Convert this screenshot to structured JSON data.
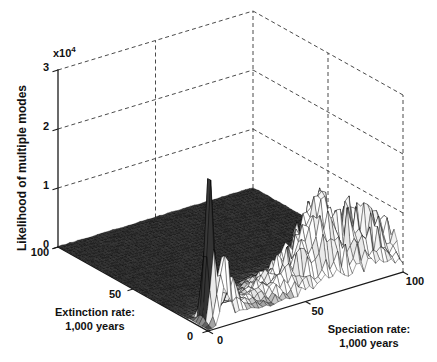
{
  "labels": {
    "z_title": "Likelihood of multiple modes",
    "mult_base": "x10",
    "mult_exp": "4",
    "x1": "Speciation rate:",
    "x2": "1,000 years",
    "y1": "Extinction rate:",
    "y2": "1,000 years"
  },
  "chart_data": {
    "type": "surface",
    "title": "",
    "x_axis": {
      "label": "Speciation rate: 1,000 years",
      "range": [
        0,
        100
      ],
      "ticks": [
        "0",
        "50",
        "100"
      ]
    },
    "y_axis": {
      "label": "Extinction rate: 1,000 years",
      "range": [
        0,
        100
      ],
      "ticks": [
        "0",
        "50",
        "100"
      ]
    },
    "z_axis": {
      "label": "Likelihood of multiple modes",
      "range": [
        0,
        30000
      ],
      "ticks": [
        "0",
        "1",
        "2",
        "3"
      ],
      "multiplier": 10000
    },
    "grid": {
      "style": "dashed",
      "back_walls": true
    },
    "colors": {
      "background": "#ffffff",
      "axis": "#1a1a1a",
      "grid_line": "#4a4a4a",
      "mesh_line": "#000000",
      "surface_dark": "#2f2f2f",
      "surface_light": "#fafafa"
    },
    "key_features": [
      {
        "name": "dominant narrow spike",
        "speciation": 6,
        "extinction": 7,
        "likelihood": 25500
      },
      {
        "name": "secondary spikes near origin",
        "speciation": 11,
        "extinction": 3,
        "likelihood": 14000
      },
      {
        "name": "broad noisy ridge",
        "speciation": 76,
        "extinction": 9,
        "likelihood": 10000
      },
      {
        "name": "flat floor elsewhere",
        "likelihood": 0
      }
    ],
    "surface_model": {
      "units": 10000,
      "grid_step": 2,
      "peaks": [
        {
          "s": 6,
          "e": 7,
          "height": 25500,
          "sigma_s": 1.6,
          "sigma_e": 2.4
        },
        {
          "s": 11,
          "e": 3,
          "height": 14000,
          "sigma_s": 1.2,
          "sigma_e": 1.8
        },
        {
          "s": 8,
          "e": 1,
          "height": 7000,
          "sigma_s": 1.3,
          "sigma_e": 1.5
        },
        {
          "s": 16,
          "e": 5,
          "height": 5000,
          "sigma_s": 1.6,
          "sigma_e": 2.0
        },
        {
          "s": 18,
          "e": 4,
          "height": 2000,
          "sigma_s": 7.0,
          "sigma_e": 5.0
        },
        {
          "s": 64,
          "e": 12,
          "height": 5000,
          "sigma_s": 6.0,
          "sigma_e": 5.0
        }
      ],
      "ridge": {
        "amplitude": 10000,
        "s_peak": 76,
        "s_sigma_left": 26,
        "s_sigma_right": 22,
        "e_center": 9,
        "e_sigma_front": 6,
        "e_sigma_back": 10,
        "noise_fraction": 0.4
      },
      "floor_noise": 150
    }
  }
}
